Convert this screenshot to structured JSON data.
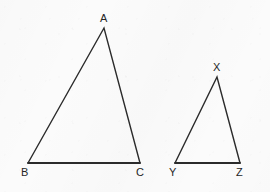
{
  "figure": {
    "background_color": "#fbfbfb",
    "stroke_color": "#2b2b2b",
    "label_color": "#262626",
    "canvas": {
      "width": 270,
      "height": 192
    },
    "shapes": [
      {
        "id": "triangle-abc",
        "name": "Triangle ABC",
        "vertices": [
          {
            "label": "A",
            "x": 104,
            "y": 28,
            "label_x": 100,
            "label_y": 13
          },
          {
            "label": "B",
            "x": 28,
            "y": 163,
            "label_x": 21,
            "label_y": 167
          },
          {
            "label": "C",
            "x": 140,
            "y": 163,
            "label_x": 136,
            "label_y": 167
          }
        ],
        "path": "M 104 28 L 28 163 L 140 163 Z",
        "base_path": "M 28 163 L 140 163",
        "side_path": "M 28 163 L 104 28 L 140 163"
      },
      {
        "id": "triangle-xyz",
        "name": "Triangle XYZ",
        "vertices": [
          {
            "label": "X",
            "x": 217,
            "y": 77,
            "label_x": 213,
            "label_y": 62
          },
          {
            "label": "Y",
            "x": 175,
            "y": 163,
            "label_x": 169,
            "label_y": 167
          },
          {
            "label": "Z",
            "x": 240,
            "y": 163,
            "label_x": 236,
            "label_y": 167
          }
        ],
        "path": "M 217 77 L 175 163 L 240 163 Z",
        "base_path": "M 175 163 L 240 163",
        "side_path": "M 175 163 L 217 77 L 240 163"
      }
    ],
    "labels": {
      "a": "A",
      "b": "B",
      "c": "C",
      "x": "X",
      "y": "Y",
      "z": "Z"
    }
  }
}
